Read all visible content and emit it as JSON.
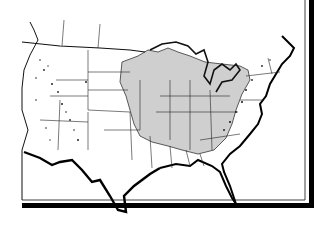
{
  "map": {
    "subject": "United States outline map with shaded central-eastern region",
    "colors": {
      "background": "#ffffff",
      "outline": "#111111",
      "shaded_region": "#cfcfcf",
      "frame": "#000000",
      "speckle": "#222222"
    },
    "legend": null,
    "labels": []
  }
}
